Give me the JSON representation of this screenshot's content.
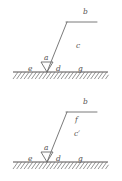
{
  "figure": {
    "title": "",
    "panels": [
      {
        "id": "panel-top",
        "name": "top-diagram",
        "labels": [
          {
            "key": "b",
            "text": "b",
            "x": 83,
            "y": 8
          },
          {
            "key": "c",
            "text": "c",
            "x": 76,
            "y": 42
          },
          {
            "key": "a",
            "text": "a",
            "x": 44,
            "y": 54
          },
          {
            "key": "e",
            "text": "e",
            "x": 28,
            "y": 65
          },
          {
            "key": "d",
            "text": "d",
            "x": 56,
            "y": 65
          },
          {
            "key": "g",
            "text": "g",
            "x": 78,
            "y": 65
          }
        ],
        "geometry": {
          "ground_line": {
            "x1": 13,
            "y1": 72,
            "x2": 108,
            "y2": 72
          },
          "slant_line": {
            "x1": 47,
            "y1": 72,
            "x2": 67,
            "y2": 22
          },
          "top_line": {
            "x1": 66,
            "y1": 22,
            "x2": 97,
            "y2": 22
          },
          "wedge": {
            "cx": 47,
            "cy": 72,
            "half_width": 6,
            "height": 10
          },
          "hatch_count": 26,
          "hatch_depth": 7
        }
      },
      {
        "id": "panel-bottom",
        "name": "bottom-diagram",
        "labels": [
          {
            "key": "b",
            "text": "b",
            "x": 83,
            "y": 8
          },
          {
            "key": "f",
            "text": "f",
            "x": 75,
            "y": 26
          },
          {
            "key": "cprime",
            "text": "c′",
            "x": 74,
            "y": 40
          },
          {
            "key": "a",
            "text": "a",
            "x": 44,
            "y": 54
          },
          {
            "key": "e",
            "text": "e",
            "x": 28,
            "y": 65
          },
          {
            "key": "d",
            "text": "d",
            "x": 56,
            "y": 65
          },
          {
            "key": "g",
            "text": "g",
            "x": 78,
            "y": 65
          }
        ],
        "geometry": {
          "ground_line": {
            "x1": 13,
            "y1": 72,
            "x2": 108,
            "y2": 72
          },
          "slant_line": {
            "x1": 47,
            "y1": 72,
            "x2": 67,
            "y2": 22
          },
          "top_line": {
            "x1": 66,
            "y1": 22,
            "x2": 97,
            "y2": 22
          },
          "wedge": {
            "cx": 47,
            "cy": 72,
            "half_width": 6,
            "height": 10
          },
          "hatch_count": 26,
          "hatch_depth": 7
        }
      }
    ],
    "style": {
      "line_color": "#6b6b6b",
      "ground_color": "#555151",
      "hatch_color": "#7a7a7a",
      "label_color": "#555151",
      "background": "#ffffff"
    }
  }
}
